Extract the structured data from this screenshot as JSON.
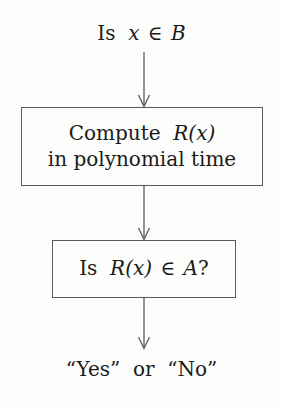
{
  "diagram": {
    "background_color": "#fdfdfb",
    "stroke_color": "#5c5c5e",
    "text_color": "#1b1b1b",
    "top_label": {
      "prefix": "Is",
      "variable": "x",
      "operator": "∈",
      "set": "B",
      "full_text": "Is x ∈ B"
    },
    "box_compute": {
      "line1_prefix": "Compute",
      "line1_math": "R(x)",
      "line1_full": "Compute R(x)",
      "line2": "in polynomial time"
    },
    "box_decide": {
      "prefix": "Is",
      "math": "R(x)",
      "operator": "∈",
      "set": "A",
      "suffix": "?",
      "full_text": "Is R(x) ∈ A?"
    },
    "bottom_label": {
      "yes": "“Yes”",
      "connector": "or",
      "no": "“No”",
      "full_text": "“Yes” or “No”"
    },
    "arrows": [
      {
        "name": "arrow-top-to-compute",
        "from": "Is x ∈ B",
        "to": "Compute R(x) in polynomial time"
      },
      {
        "name": "arrow-compute-to-decide",
        "from": "Compute R(x) in polynomial time",
        "to": "Is R(x) ∈ A?"
      },
      {
        "name": "arrow-decide-to-answer",
        "from": "Is R(x) ∈ A?",
        "to": "“Yes” or “No”"
      }
    ]
  }
}
